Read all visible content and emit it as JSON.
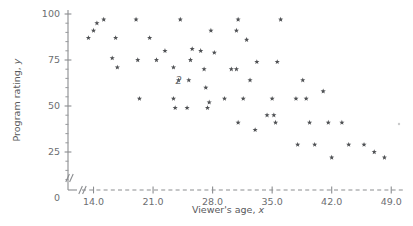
{
  "chart_data": {
    "type": "scatter",
    "title": "",
    "xlabel": "Viewer's age, x",
    "ylabel": "Program rating, y",
    "xlim": [
      11.0,
      50.5
    ],
    "ylim": [
      0,
      103
    ],
    "xticks": [
      "14.0",
      "21.0",
      "28.0",
      "35.0",
      "42.0",
      "49.0"
    ],
    "xtick_values": [
      14.0,
      21.0,
      28.0,
      35.0,
      42.0,
      49.0
    ],
    "yticks": [
      "0",
      "25",
      "50",
      "75",
      "100"
    ],
    "ytick_values": [
      0,
      25,
      50,
      75,
      100
    ],
    "y_minor_count_between": 4,
    "grid": false,
    "legend": null,
    "axis_break_x": true,
    "axis_break_y": true,
    "marker_symbol": "star",
    "marker_color": "#4f5154",
    "axis_color": "#8b8d90",
    "text_color": "#5d5f62",
    "background": "#ffffff",
    "overlap_labels": [
      {
        "x": 24.0,
        "y": 64.0,
        "text": "2"
      }
    ],
    "points": [
      {
        "x": 13.4,
        "y": 87.0
      },
      {
        "x": 14.0,
        "y": 91.0
      },
      {
        "x": 14.4,
        "y": 95.0
      },
      {
        "x": 15.2,
        "y": 97.0
      },
      {
        "x": 16.2,
        "y": 76.0
      },
      {
        "x": 16.6,
        "y": 87.0
      },
      {
        "x": 16.8,
        "y": 71.0
      },
      {
        "x": 19.0,
        "y": 97.0
      },
      {
        "x": 19.2,
        "y": 75.0
      },
      {
        "x": 19.4,
        "y": 54.0
      },
      {
        "x": 20.6,
        "y": 87.0
      },
      {
        "x": 21.4,
        "y": 75.0
      },
      {
        "x": 22.4,
        "y": 80.0
      },
      {
        "x": 23.4,
        "y": 71.0
      },
      {
        "x": 23.4,
        "y": 54.0
      },
      {
        "x": 23.6,
        "y": 49.0
      },
      {
        "x": 24.0,
        "y": 64.0
      },
      {
        "x": 24.2,
        "y": 97.0
      },
      {
        "x": 25.0,
        "y": 49.0
      },
      {
        "x": 25.2,
        "y": 64.0
      },
      {
        "x": 25.4,
        "y": 75.0
      },
      {
        "x": 25.6,
        "y": 81.0
      },
      {
        "x": 26.6,
        "y": 80.0
      },
      {
        "x": 27.0,
        "y": 70.0
      },
      {
        "x": 27.2,
        "y": 60.0
      },
      {
        "x": 27.4,
        "y": 49.0
      },
      {
        "x": 27.6,
        "y": 52.0
      },
      {
        "x": 27.8,
        "y": 91.0
      },
      {
        "x": 28.2,
        "y": 79.0
      },
      {
        "x": 29.4,
        "y": 54.0
      },
      {
        "x": 30.2,
        "y": 70.0
      },
      {
        "x": 30.8,
        "y": 70.0
      },
      {
        "x": 30.8,
        "y": 91.0
      },
      {
        "x": 31.0,
        "y": 97.0
      },
      {
        "x": 31.0,
        "y": 41.0
      },
      {
        "x": 31.6,
        "y": 54.0
      },
      {
        "x": 32.0,
        "y": 86.0
      },
      {
        "x": 32.4,
        "y": 64.0
      },
      {
        "x": 33.0,
        "y": 37.0
      },
      {
        "x": 33.2,
        "y": 74.0
      },
      {
        "x": 34.4,
        "y": 45.0
      },
      {
        "x": 35.0,
        "y": 54.0
      },
      {
        "x": 35.2,
        "y": 45.0
      },
      {
        "x": 35.4,
        "y": 41.0
      },
      {
        "x": 35.6,
        "y": 74.0
      },
      {
        "x": 36.0,
        "y": 97.0
      },
      {
        "x": 37.8,
        "y": 54.0
      },
      {
        "x": 38.0,
        "y": 29.0
      },
      {
        "x": 38.6,
        "y": 64.0
      },
      {
        "x": 39.0,
        "y": 54.0
      },
      {
        "x": 39.4,
        "y": 41.0
      },
      {
        "x": 40.0,
        "y": 29.0
      },
      {
        "x": 41.0,
        "y": 58.0
      },
      {
        "x": 41.6,
        "y": 41.0
      },
      {
        "x": 42.0,
        "y": 22.0
      },
      {
        "x": 43.2,
        "y": 41.0
      },
      {
        "x": 44.0,
        "y": 29.0
      },
      {
        "x": 45.8,
        "y": 29.0
      },
      {
        "x": 47.0,
        "y": 25.0
      },
      {
        "x": 48.2,
        "y": 22.0
      }
    ]
  },
  "labels": {
    "xaxis_prefix": "Viewer's age, ",
    "xaxis_var": "x",
    "yaxis_prefix": "Program rating, ",
    "yaxis_var": "y"
  }
}
